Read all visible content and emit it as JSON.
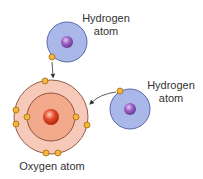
{
  "diagram": {
    "labels": {
      "hydrogen_top_line1": "Hydrogen",
      "hydrogen_top_line2": "atom",
      "hydrogen_right_line1": "Hydrogen",
      "hydrogen_right_line2": "atom",
      "oxygen": "Oxygen atom"
    },
    "colors": {
      "hydrogen_fill": "#a9b8e8",
      "hydrogen_stroke": "#5a6aa8",
      "hydrogen_nucleus": "#8a55b8",
      "oxygen_outer_fill": "#f6c9b8",
      "oxygen_inner_fill": "#f2a98c",
      "oxygen_stroke": "#7a3a2a",
      "oxygen_nucleus": "#d8402a",
      "electron_fill": "#f2b63a",
      "electron_stroke": "#a86a10",
      "arrow": "#333333"
    }
  }
}
